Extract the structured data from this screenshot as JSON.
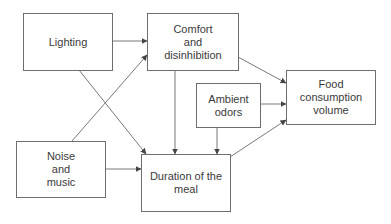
{
  "nodes": {
    "lighting": {
      "label": "Lighting"
    },
    "comfort": {
      "label": "Comfort\nand\ndisinhibition"
    },
    "food": {
      "label": "Food consumption\nvolume"
    },
    "odors": {
      "label": "Ambient\nodors"
    },
    "noise": {
      "label": "Noise\nand\nmusic"
    },
    "duration": {
      "label": "Duration of the\nmeal"
    }
  },
  "edges": [
    {
      "from": "lighting",
      "to": "comfort"
    },
    {
      "from": "lighting",
      "to": "duration"
    },
    {
      "from": "noise",
      "to": "comfort"
    },
    {
      "from": "noise",
      "to": "duration"
    },
    {
      "from": "comfort",
      "to": "duration"
    },
    {
      "from": "comfort",
      "to": "food"
    },
    {
      "from": "odors",
      "to": "food"
    },
    {
      "from": "odors",
      "to": "duration"
    },
    {
      "from": "duration",
      "to": "food"
    }
  ],
  "colors": {
    "line": "#555555",
    "border": "#6e6e6e",
    "text": "#3a3a3a"
  }
}
